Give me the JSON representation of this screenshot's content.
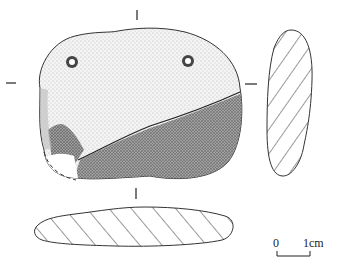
{
  "figure": {
    "type": "archaeological artifact drawing (perforated stone/pendant)",
    "views": [
      "front-face",
      "side-section",
      "bottom-section"
    ]
  },
  "scale_bar": {
    "start_label": "0",
    "end_label": "1cm"
  },
  "colors": {
    "ink": "#222222",
    "background": "#ffffff",
    "stipple_light": "#d8d8d8",
    "stipple_dark": "#555555"
  }
}
